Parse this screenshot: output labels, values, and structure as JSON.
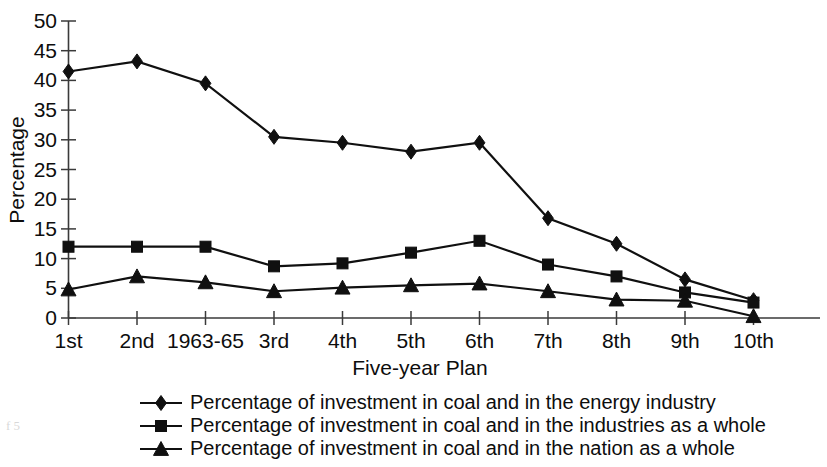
{
  "chart_data": {
    "type": "line",
    "title": "",
    "xlabel": "Five-year Plan",
    "ylabel": "Percentage",
    "categories": [
      "1st",
      "2nd",
      "1963-65",
      "3rd",
      "4th",
      "5th",
      "6th",
      "7th",
      "8th",
      "9th",
      "10th"
    ],
    "ylim": [
      0,
      50
    ],
    "yticks": [
      0,
      5,
      10,
      15,
      20,
      25,
      30,
      35,
      40,
      45,
      50
    ],
    "grid": false,
    "legend_position": "bottom",
    "series": [
      {
        "name": "Percentage of investment in coal and in the energy industry",
        "marker": "diamond",
        "values": [
          41.5,
          43.2,
          39.5,
          30.5,
          29.5,
          28.0,
          29.5,
          16.8,
          12.5,
          6.5,
          3.0
        ]
      },
      {
        "name": "Percentage of investment in coal and in the industries as a whole",
        "marker": "square",
        "values": [
          12.0,
          12.0,
          12.0,
          8.7,
          9.2,
          11.0,
          13.0,
          9.0,
          7.0,
          4.3,
          2.6
        ]
      },
      {
        "name": "Percentage of investment in coal and in the nation as a whole",
        "marker": "triangle",
        "values": [
          4.8,
          7.0,
          6.0,
          4.5,
          5.1,
          5.5,
          5.8,
          4.5,
          3.1,
          2.9,
          0.3
        ]
      }
    ]
  },
  "colors": {
    "series_line": "#101010",
    "axis": "#3a3a3a",
    "text": "#0d0d0d",
    "background": "#ffffff"
  },
  "legend": {
    "entries": [
      "Percentage of investment in coal and in the energy industry",
      "Percentage of investment in coal and in the industries as a whole",
      "Percentage of investment in coal and in the nation as a whole"
    ]
  },
  "artifact": {
    "corner_mark": "f 5"
  }
}
